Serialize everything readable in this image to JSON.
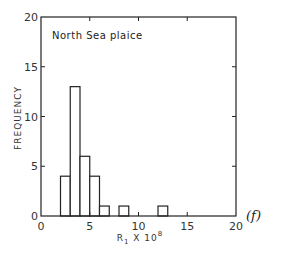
{
  "chart_data": {
    "type": "bar",
    "title": "North Sea plaice",
    "xlabel": "R₁ X 10⁸",
    "xlabel_parts": {
      "base": "R",
      "subscript": "1",
      "rest": " X 10",
      "superscript": "8"
    },
    "ylabel": "FREQUENCY",
    "panel_label": "(f)",
    "xlim": [
      0,
      20
    ],
    "ylim": [
      0,
      20
    ],
    "xticks": [
      0,
      5,
      10,
      15,
      20
    ],
    "xtick_labels": [
      "0",
      "5",
      "10",
      "15",
      "20"
    ],
    "yticks": [
      0,
      5,
      10,
      15,
      20
    ],
    "ytick_labels": [
      "0",
      "5",
      "10",
      "15",
      "20"
    ],
    "grid": false,
    "bin_width": 1,
    "bins": [
      {
        "x0": 2,
        "x1": 3,
        "count": 4
      },
      {
        "x0": 3,
        "x1": 4,
        "count": 13
      },
      {
        "x0": 4,
        "x1": 5,
        "count": 6
      },
      {
        "x0": 5,
        "x1": 6,
        "count": 4
      },
      {
        "x0": 6,
        "x1": 7,
        "count": 1
      },
      {
        "x0": 8,
        "x1": 9,
        "count": 1
      },
      {
        "x0": 12,
        "x1": 13,
        "count": 1
      }
    ],
    "categories": [
      "2-3",
      "3-4",
      "4-5",
      "5-6",
      "6-7",
      "8-9",
      "12-13"
    ],
    "values": [
      4,
      13,
      6,
      4,
      1,
      1,
      1
    ]
  },
  "colors": {
    "line": "#222222",
    "fill": "#ffffff"
  }
}
